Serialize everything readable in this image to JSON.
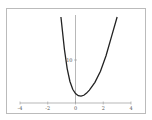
{
  "chart_data": {
    "type": "line",
    "title": "",
    "xlabel": "",
    "ylabel": "",
    "xlim": [
      -4,
      4
    ],
    "ylim": [
      0,
      20
    ],
    "grid": false,
    "legend": null,
    "x_ticks": [
      -4,
      -2,
      0,
      2,
      4
    ],
    "y_ticks": [
      10
    ],
    "x_tick_labels": [
      "-4",
      "-2",
      "0",
      "2",
      "4"
    ],
    "y_tick_labels": [
      "10"
    ],
    "series": [
      {
        "name": "f(x)",
        "color": "#222222",
        "x": [
          -1.05,
          -0.8,
          -0.6,
          -0.4,
          -0.2,
          0.0,
          0.2,
          0.4,
          0.6,
          0.8,
          1.0,
          1.4,
          1.8,
          2.2,
          2.6,
          3.0
        ],
        "y": [
          20.0,
          12.5,
          8.0,
          5.0,
          3.2,
          2.2,
          1.7,
          1.6,
          1.8,
          2.3,
          3.0,
          4.8,
          7.4,
          11.0,
          15.5,
          20.0
        ]
      }
    ]
  },
  "colors": {
    "frame": "#bbbbbb",
    "axis": "#999999",
    "curve": "#222222",
    "background": "#ffffff"
  }
}
